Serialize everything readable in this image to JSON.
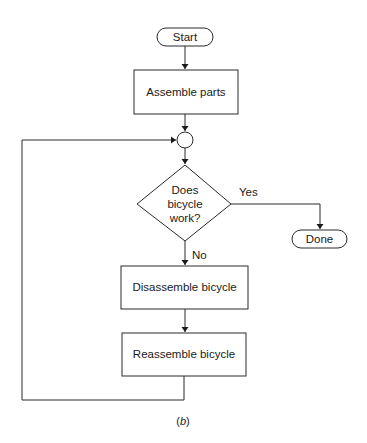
{
  "diagram": {
    "type": "flowchart",
    "nodes": {
      "start": {
        "label": "Start",
        "shape": "terminator"
      },
      "assemble": {
        "label": "Assemble parts",
        "shape": "process"
      },
      "junction": {
        "label": "",
        "shape": "connector"
      },
      "decision": {
        "line1": "Does",
        "line2": "bicycle",
        "line3": "work?",
        "shape": "decision"
      },
      "done": {
        "label": "Done",
        "shape": "terminator"
      },
      "disassemble": {
        "label": "Disassemble bicycle",
        "shape": "process"
      },
      "reassemble": {
        "label": "Reassemble bicycle",
        "shape": "process"
      }
    },
    "edges": {
      "yes_label": "Yes",
      "no_label": "No"
    },
    "caption_open": "(",
    "caption_letter": "b",
    "caption_close": ")"
  }
}
